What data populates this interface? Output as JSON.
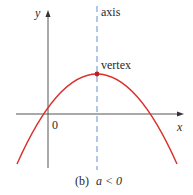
{
  "figure": {
    "caption_prefix": "(b)",
    "caption_condition": "a < 0",
    "labels": {
      "y_axis": "y",
      "x_axis": "x",
      "origin": "0",
      "axis_of_symmetry": "axis",
      "vertex": "vertex"
    },
    "colors": {
      "curve": "#d9302a",
      "axis_line": "#7fa3d6",
      "coordinate_axes": "#555555",
      "text": "#2a2a2a"
    },
    "parabola": {
      "opens": "downward",
      "vertex_px": [
        97,
        74
      ],
      "x_intercepts_px": [
        43,
        151
      ],
      "x_axis_y_px": 114,
      "y_axis_x_px": 48
    }
  }
}
